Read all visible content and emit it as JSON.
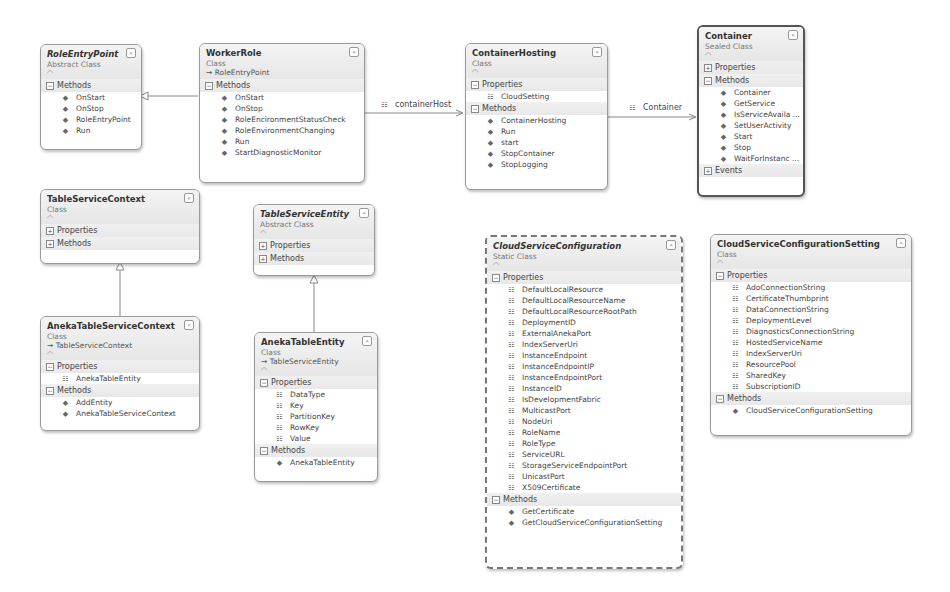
{
  "classes": {
    "role_entry_point": {
      "name": "RoleEntryPoint",
      "kind": "Abstract Class",
      "sections": {
        "methods_label": "Methods"
      },
      "methods": [
        "OnStart",
        "OnStop",
        "RoleEntryPoint",
        "Run"
      ]
    },
    "worker_role": {
      "name": "WorkerRole",
      "kind": "Class",
      "inherits": "RoleEntryPoint",
      "sections": {
        "methods_label": "Methods"
      },
      "methods": [
        "OnStart",
        "OnStop",
        "RoleEncironmentStatusCheck",
        "RoleEnvironmentChanging",
        "Run",
        "StartDiagnosticMonitor"
      ]
    },
    "container_hosting": {
      "name": "ContainerHosting",
      "kind": "Class",
      "sections": {
        "properties_label": "Properties",
        "methods_label": "Methods"
      },
      "properties": [
        "CloudSetting"
      ],
      "methods": [
        "ContainerHosting",
        "Run",
        "start",
        "StopContainer",
        "StopLogging"
      ]
    },
    "container": {
      "name": "Container",
      "kind": "Sealed Class",
      "sections": {
        "properties_label": "Properties",
        "methods_label": "Methods",
        "events_label": "Events"
      },
      "methods": [
        "Container",
        "GetService",
        "IsServiceAvaila ...",
        "SetUserActivity",
        "Start",
        "Stop",
        "WaitForInstanc ..."
      ]
    },
    "table_service_context": {
      "name": "TableServiceContext",
      "kind": "Class",
      "sections": {
        "properties_label": "Properties",
        "methods_label": "Methods"
      }
    },
    "table_service_entity": {
      "name": "TableServiceEntity",
      "kind": "Abstract Class",
      "sections": {
        "properties_label": "Properties",
        "methods_label": "Methods"
      }
    },
    "aneka_table_service_context": {
      "name": "AnekaTableServiceContext",
      "kind": "Class",
      "inherits": "TableServiceContext",
      "sections": {
        "properties_label": "Properties",
        "methods_label": "Methods"
      },
      "properties": [
        "AnekaTableEntity"
      ],
      "methods": [
        "AddEntity",
        "AnekaTableServiceContext"
      ]
    },
    "aneka_table_entity": {
      "name": "AnekaTableEntity",
      "kind": "Class",
      "inherits": "TableServiceEntity",
      "sections": {
        "properties_label": "Properties",
        "methods_label": "Methods"
      },
      "properties": [
        "DataType",
        "Key",
        "PartitionKey",
        "RowKey",
        "Value"
      ],
      "methods": [
        "AnekaTableEntity"
      ]
    },
    "cloud_service_configuration": {
      "name": "CloudServiceConfiguration",
      "kind": "Static Class",
      "sections": {
        "properties_label": "Properties",
        "methods_label": "Methods"
      },
      "properties": [
        "DefaultLocalResource",
        "DefaultLocalResourceName",
        "DefaultLocalResourceRootPath",
        "DeploymentID",
        "ExternalAnekaPort",
        "IndexServerUri",
        "InstanceEndpoint",
        "InstanceEndpointIP",
        "InstanceEndpointPort",
        "InstanceID",
        "IsDevelopmentFabric",
        "MulticastPort",
        "NodeUri",
        "RoleName",
        "RoleType",
        "ServiceURL",
        "StorageServiceEndpointPort",
        "UnicastPort",
        "X509Certificate"
      ],
      "methods": [
        "GetCertificate",
        "GetCloudServiceConfigurationSetting"
      ]
    },
    "cloud_service_configuration_setting": {
      "name": "CloudServiceConfigurationSetting",
      "kind": "Class",
      "sections": {
        "properties_label": "Properties",
        "methods_label": "Methods"
      },
      "properties": [
        "AdoConnectionString",
        "CertificateThumbprint",
        "DataConnectionString",
        "DeploymentLevel",
        "DiagnosticsConnectionString",
        "HostedServiceName",
        "IndexServerUri",
        "ResourcePool",
        "SharedKey",
        "SubscriptionID"
      ],
      "methods": [
        "CloudServiceConfigurationSetting"
      ]
    }
  },
  "associations": {
    "container_host": "containerHost",
    "container": "Container"
  },
  "symbols": {
    "expanded": "⊟",
    "collapsed": "⊞",
    "collapse_toggle": "«",
    "inherit_arrow": "→"
  }
}
